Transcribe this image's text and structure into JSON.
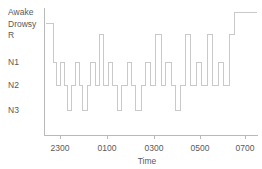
{
  "chart_data": {
    "type": "line",
    "title": "",
    "subtitle": "",
    "xlabel": "Time",
    "ylabel": "",
    "grid": false,
    "legend": "none",
    "line_style": "step-post",
    "line_color": "#c9c9c9",
    "axis_color": "#b9b9b9",
    "background_color": "#ffffff",
    "y_categories": [
      "Awake",
      "Drowsy",
      "R",
      "N1",
      "N2",
      "N3"
    ],
    "y_category_values": [
      0,
      1,
      2,
      3,
      4,
      5
    ],
    "y_tick_labels": [
      "Awake",
      "Drowsy",
      "R",
      "N1",
      "N2",
      "N3"
    ],
    "x_tick_labels": [
      "2300",
      "0100",
      "0300",
      "0500",
      "0700"
    ],
    "x_tick_values": [
      23.0,
      1.0,
      3.0,
      5.0,
      7.0
    ],
    "xlim": [
      22.6,
      8.2
    ],
    "ylim": [
      5.6,
      -0.4
    ],
    "series": [
      {
        "name": "Sleep stage",
        "x": [
          22.6,
          22.75,
          22.95,
          23.1,
          23.3,
          23.45,
          23.6,
          23.8,
          23.95,
          24.15,
          24.3,
          24.5,
          24.65,
          24.85,
          25.05,
          25.25,
          25.45,
          25.65,
          25.85,
          26.05,
          26.3,
          26.5,
          26.7,
          26.95,
          27.15,
          27.35,
          27.6,
          27.85,
          28.05,
          28.3,
          28.5,
          28.75,
          28.95,
          29.2,
          29.45,
          29.7,
          29.95,
          30.2,
          30.45,
          30.7,
          30.95,
          31.2,
          31.2
        ],
        "y_labels": [
          "Drowsy",
          "Drowsy",
          "N1",
          "N2",
          "N1",
          "N2",
          "N3",
          "N2",
          "N1",
          "N2",
          "N3",
          "N2",
          "N1",
          "N2",
          "R",
          "N2",
          "N1",
          "N2",
          "N3",
          "N2",
          "N1",
          "N2",
          "N3",
          "N2",
          "N1",
          "N2",
          "R",
          "N2",
          "N1",
          "N2",
          "N3",
          "N2",
          "R",
          "N2",
          "N1",
          "N2",
          "R",
          "N2",
          "N1",
          "N2",
          "R",
          "Awake",
          "Awake"
        ],
        "y": [
          1,
          1,
          3,
          4,
          3,
          4,
          5,
          4,
          3,
          4,
          5,
          4,
          3,
          4,
          2,
          4,
          3,
          4,
          5,
          4,
          3,
          4,
          5,
          4,
          3,
          4,
          2,
          4,
          3,
          4,
          5,
          4,
          2,
          4,
          3,
          4,
          2,
          4,
          3,
          4,
          2,
          0,
          0
        ]
      }
    ]
  },
  "axes": {
    "y_labels": [
      {
        "text": "Awake",
        "value": 0
      },
      {
        "text": "Drowsy",
        "value": 1
      },
      {
        "text": "R",
        "value": 2
      },
      {
        "text": "N1",
        "value": 3
      },
      {
        "text": "N2",
        "value": 4
      },
      {
        "text": "N3",
        "value": 5
      }
    ],
    "x_labels": [
      {
        "text": "2300",
        "value": 23.0
      },
      {
        "text": "0100",
        "value": 1.0
      },
      {
        "text": "0300",
        "value": 3.0
      },
      {
        "text": "0500",
        "value": 5.0
      },
      {
        "text": "0700",
        "value": 7.0
      }
    ],
    "x_axis_title": "Time"
  }
}
